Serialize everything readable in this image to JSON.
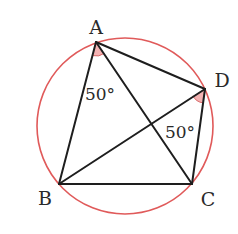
{
  "diagram": {
    "type": "inscribed-quadrilateral",
    "circle": {
      "cx": 125,
      "cy": 126,
      "r": 88,
      "color": "#e05a5a"
    },
    "points": {
      "A": {
        "label": "A",
        "x": 96,
        "y": 42,
        "lx": 96,
        "ly": 33
      },
      "B": {
        "label": "B",
        "x": 59,
        "y": 184,
        "lx": 44,
        "ly": 205
      },
      "C": {
        "label": "C",
        "x": 192,
        "y": 184,
        "lx": 208,
        "ly": 205
      },
      "D": {
        "label": "D",
        "x": 205,
        "y": 89,
        "lx": 222,
        "ly": 86
      }
    },
    "segments": [
      "AB",
      "AC",
      "AD",
      "BC",
      "BD",
      "CD"
    ],
    "angles": [
      {
        "vertex": "A",
        "between": [
          "B",
          "C"
        ],
        "label": "50°",
        "lx": 100,
        "ly": 100
      },
      {
        "vertex": "D",
        "between": [
          "B",
          "C"
        ],
        "label": "50°",
        "lx": 180,
        "ly": 138
      }
    ],
    "angle_fill": "#f4b3b3",
    "angle_stroke": "#d96a6a",
    "line_color": "#1e1e1e"
  }
}
